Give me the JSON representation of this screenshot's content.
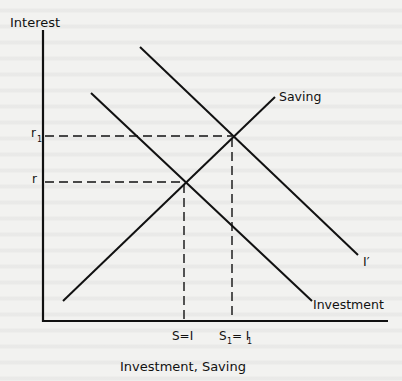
{
  "diagram": {
    "y_axis_label": "Interest",
    "x_axis_label": "Investment, Saving",
    "curves": {
      "saving": "Saving",
      "investment": "Investment",
      "investment_shifted": "I′"
    },
    "y_ticks": {
      "r1": "r",
      "r1_sub": "1",
      "r": "r"
    },
    "x_ticks": {
      "s_eq_i": "S=I",
      "s1_prefix": "S",
      "s1_sub": "1",
      "s1_mid": "= I",
      "s1_sub2": "1"
    },
    "colors": {
      "ink": "#111111",
      "paper": "#f2f2f0"
    }
  }
}
